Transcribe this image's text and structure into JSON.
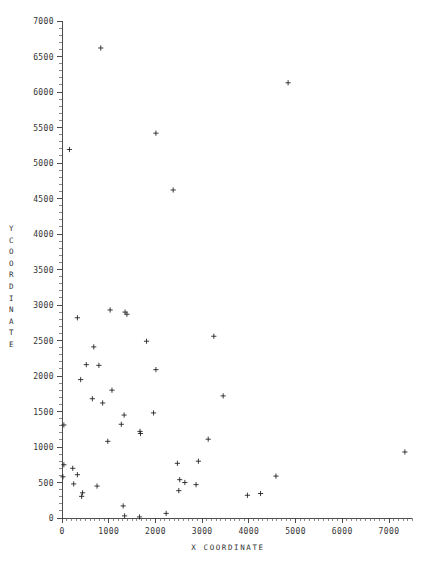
{
  "chart_data": {
    "type": "scatter",
    "title": "",
    "xlabel": "X COORDINATE",
    "ylabel": "Y COORDINATE",
    "xlim": [
      0,
      7500
    ],
    "ylim": [
      0,
      7000
    ],
    "xticks": [
      0,
      1000,
      2000,
      3000,
      4000,
      5000,
      6000,
      7000
    ],
    "xtick_labels": [
      "0",
      "1000",
      "2000",
      "3000",
      "4000",
      "5000",
      "6000",
      "7000"
    ],
    "yticks": [
      0,
      500,
      1000,
      1500,
      2000,
      2500,
      3000,
      3500,
      4000,
      4500,
      5000,
      5500,
      6000,
      6500,
      7000
    ],
    "ytick_labels": [
      "0",
      "500",
      "1000",
      "1500",
      "2000",
      "2500",
      "3000",
      "3500",
      "4000",
      "4500",
      "5000",
      "5500",
      "6000",
      "6500",
      "7000"
    ],
    "grid": false,
    "legend": null,
    "marker": "plus",
    "marker_color": "#1a1a1a",
    "n_points": 56,
    "points": [
      [
        830,
        6620
      ],
      [
        4840,
        6130
      ],
      [
        2010,
        5420
      ],
      [
        160,
        5190
      ],
      [
        2380,
        4620
      ],
      [
        1030,
        2930
      ],
      [
        1350,
        2900
      ],
      [
        1390,
        2870
      ],
      [
        330,
        2820
      ],
      [
        1810,
        2490
      ],
      [
        680,
        2410
      ],
      [
        2010,
        2090
      ],
      [
        520,
        2160
      ],
      [
        790,
        2150
      ],
      [
        3250,
        2560
      ],
      [
        400,
        1950
      ],
      [
        1070,
        1800
      ],
      [
        3450,
        1720
      ],
      [
        650,
        1680
      ],
      [
        870,
        1620
      ],
      [
        1330,
        1450
      ],
      [
        1960,
        1480
      ],
      [
        1270,
        1320
      ],
      [
        40,
        1310
      ],
      [
        1670,
        1220
      ],
      [
        1680,
        1190
      ],
      [
        3130,
        1110
      ],
      [
        980,
        1080
      ],
      [
        7340,
        930
      ],
      [
        2470,
        770
      ],
      [
        2920,
        800
      ],
      [
        40,
        750
      ],
      [
        230,
        700
      ],
      [
        330,
        610
      ],
      [
        20,
        580
      ],
      [
        2520,
        540
      ],
      [
        2630,
        500
      ],
      [
        2870,
        470
      ],
      [
        250,
        480
      ],
      [
        750,
        450
      ],
      [
        4580,
        590
      ],
      [
        2500,
        385
      ],
      [
        440,
        355
      ],
      [
        420,
        305
      ],
      [
        4250,
        345
      ],
      [
        3970,
        320
      ],
      [
        1310,
        170
      ],
      [
        1340,
        30
      ],
      [
        1660,
        15
      ],
      [
        2230,
        65
      ]
    ]
  },
  "axis": {
    "y_title_chars": [
      "Y",
      "C",
      "O",
      "O",
      "R",
      "D",
      "I",
      "N",
      "A",
      "T",
      "E"
    ],
    "x_title": "X COORDINATE"
  }
}
